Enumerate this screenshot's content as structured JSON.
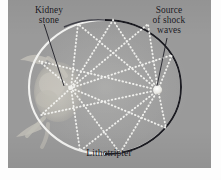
{
  "figure": {
    "type": "diagram",
    "background_color": "#9a9a9a",
    "frame_color": "#fdfdfd"
  },
  "labels": {
    "kidney_stone": "Kidney\nstone",
    "source_of_shock_waves": "Source\nof shock\nwaves",
    "lithotripter": "Lithotripter"
  },
  "diagram": {
    "ellipse": {
      "center_x": 97,
      "center_y": 87,
      "radius_x": 76,
      "radius_y": 67,
      "bright_arc_color": "#f2f2f0",
      "dark_arc_color": "#1a1a20"
    },
    "focus_left": {
      "name": "kidney-stone-focus",
      "x": 63,
      "y": 88,
      "marker": "none"
    },
    "focus_right": {
      "name": "shock-wave-source-focus",
      "x": 150,
      "y": 90,
      "marker": "dot",
      "dot_radius": 4.2,
      "dot_color": "#efefec"
    },
    "rays": {
      "style": "dotted",
      "color": "#f4f4f1",
      "dot_radius": 0.95,
      "dot_spacing": 3.4,
      "count": 9,
      "reflection_angles_deg": [
        28,
        56,
        84,
        112,
        140,
        205,
        240,
        274,
        310
      ]
    },
    "leader_lines": [
      {
        "name": "kidney-stone-leader",
        "x1": 44,
        "y1": 30,
        "x2": 62,
        "y2": 88
      },
      {
        "name": "shock-source-leader",
        "x1": 166,
        "y1": 41,
        "x2": 151,
        "y2": 87
      }
    ],
    "patient_figure": {
      "name": "patient-silhouette",
      "color": "#c9c6bd",
      "description": "faint reclining patient overlapping the left focus"
    }
  }
}
